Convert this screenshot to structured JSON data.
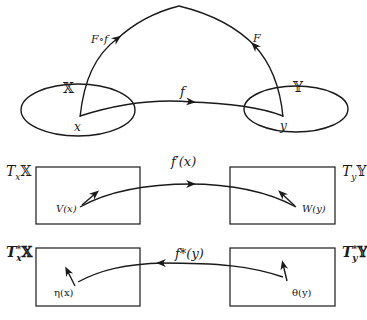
{
  "diagram": {
    "top": {
      "space_x_label": "𝕏",
      "space_y_label": "𝕐",
      "point_x_label": "x",
      "point_y_label": "y",
      "map_f_label": "f",
      "composite_label": "F∘f",
      "functional_label": "F"
    },
    "tangent_row": {
      "left_label_T": "T",
      "left_label_sub": "x",
      "left_label_space": "𝕏",
      "right_label_T": "T",
      "right_label_sub": "y",
      "right_label_space": "𝕐",
      "map_label": "f′(x)",
      "vector_left": "V(x)",
      "vector_right": "W(y)"
    },
    "cotangent_row": {
      "left_label_T": "T",
      "left_label_sup": "*",
      "left_label_sub": "x",
      "left_label_space": "𝕏",
      "right_label_T": "T",
      "right_label_sup": "*",
      "right_label_sub": "y",
      "right_label_space": "𝕐",
      "map_label": "f*(y)",
      "covector_left": "η(x)",
      "covector_right": "θ(y)"
    },
    "colors": {
      "ink": "#1a1a1a",
      "background": "#ffffff"
    }
  }
}
